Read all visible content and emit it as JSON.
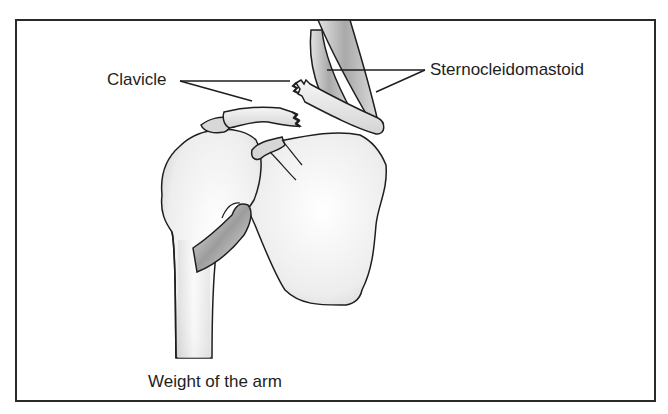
{
  "diagram": {
    "labels": {
      "clavicle": "Clavicle",
      "sternocleidomastoid": "Sternocleidomastoid",
      "weight_of_arm": "Weight of the arm"
    },
    "structures": [
      "clavicle-lateral-fragment",
      "clavicle-medial-fragment",
      "sternocleidomastoid-muscle",
      "humerus",
      "scapula",
      "acromion",
      "coracoid-process",
      "biceps-tendon"
    ],
    "colors": {
      "outline": "#1e1e1e",
      "bone_fill": "#eeeeee",
      "muscle_fill": "#b8b8b8",
      "frame": "#2a2a2a",
      "background": "#ffffff"
    }
  }
}
